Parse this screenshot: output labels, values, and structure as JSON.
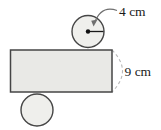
{
  "diagram": {
    "type": "cylinder-net",
    "labels": {
      "radius": "4 cm",
      "height": "9 cm"
    },
    "colors": {
      "rectangle_fill": "#e9e9e6",
      "circle_fill": "#efefec",
      "outline": "#454545",
      "dashed_arc": "#b9b9b9",
      "leader_line": "#6f6f6f",
      "text": "#1a1a1a",
      "background": "#ffffff"
    }
  }
}
